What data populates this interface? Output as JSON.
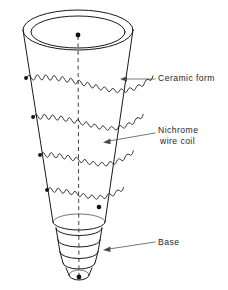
{
  "figure": {
    "background_color": "#ffffff",
    "ink_color": "#1a1a1a",
    "width": 228,
    "height": 290
  },
  "labels": [
    {
      "id": "ceramic-form",
      "text": "Ceramic form",
      "lines": [
        "Ceramic form"
      ],
      "text_x": 158,
      "text_y": 79,
      "leader_from_x": 155,
      "leader_from_y": 79,
      "leader_to_x": 121,
      "leader_to_y": 79,
      "arrow_direction": "left"
    },
    {
      "id": "nichrome-wire-coil",
      "text": "Nichrome wire coil",
      "lines": [
        "Nichrome",
        "wire coil"
      ],
      "text_x": 158,
      "text_y": 131,
      "line_height": 11,
      "leader_from_x": 155,
      "leader_from_y": 133,
      "leader_to_x": 104,
      "leader_to_y": 143,
      "arrow_direction": "left-down"
    },
    {
      "id": "base",
      "text": "Base",
      "lines": [
        "Base"
      ],
      "text_x": 158,
      "text_y": 243,
      "leader_from_x": 155,
      "leader_from_y": 243,
      "leader_to_x": 103,
      "leader_to_y": 250,
      "arrow_direction": "left"
    }
  ],
  "components": {
    "ceramic_form": {
      "name": "ceramic form",
      "shape": "truncated cone",
      "top_rim_rings": 2,
      "top_center_x": 78,
      "top_center_y": 30,
      "top_rx": 55,
      "top_ry": 20,
      "bottom_center_x": 79,
      "bottom_center_y": 222,
      "bottom_rx": 26,
      "bottom_ry": 8
    },
    "coil": {
      "name": "nichrome wire coil",
      "band_count": 4,
      "turns_per_band": [
        30,
        26,
        23,
        19
      ],
      "terminal_dots": 5
    },
    "base": {
      "name": "edison screw base",
      "thread_rings": 4,
      "tip_contact_dot": true,
      "center_x": 79,
      "top_y": 224,
      "bottom_y": 280
    },
    "center_axis": {
      "name": "dashed center axis",
      "style": "dashed",
      "top_x": 78,
      "top_y": 36,
      "bottom_x": 79,
      "bottom_y": 277
    }
  }
}
